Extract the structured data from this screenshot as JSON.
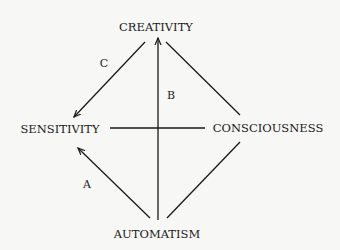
{
  "diagram": {
    "nodes": {
      "top": "CREATIVITY",
      "left": "SENSITIVITY",
      "right": "CONSCIOUSNESS",
      "bottom": "AUTOMATISM"
    },
    "edge_labels": {
      "a": "A",
      "b": "B",
      "c": "C"
    },
    "edges": [
      {
        "from": "AUTOMATISM",
        "to": "SENSITIVITY",
        "label": "A",
        "arrow": true
      },
      {
        "from": "AUTOMATISM",
        "to": "CREATIVITY",
        "label": "B",
        "arrow": true
      },
      {
        "from": "CREATIVITY",
        "to": "SENSITIVITY",
        "label": "C",
        "arrow": true
      },
      {
        "from": "CREATIVITY",
        "to": "CONSCIOUSNESS",
        "label": "",
        "arrow": false
      },
      {
        "from": "AUTOMATISM",
        "to": "CONSCIOUSNESS",
        "label": "",
        "arrow": false
      },
      {
        "from": "SENSITIVITY",
        "to": "CONSCIOUSNESS",
        "label": "",
        "arrow": false
      }
    ],
    "line_color": "#1a1a1a",
    "background": "#f7f7f5"
  }
}
